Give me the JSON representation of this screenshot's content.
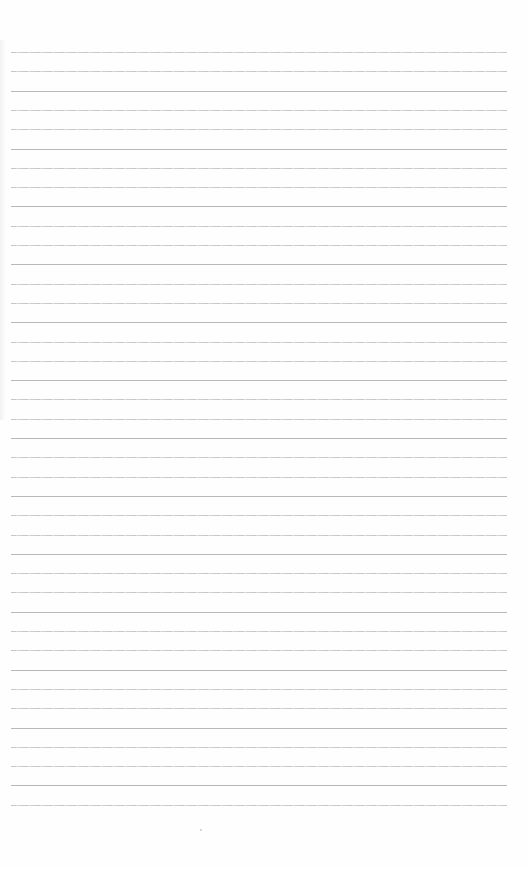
{
  "page": {
    "type": "blank ruled notebook paper",
    "background": "#fefefe",
    "rule_color": "#c4c4c4",
    "rule_count": 40,
    "rule_start_y": 52,
    "rule_spacing": 19.3,
    "rule_left": 11,
    "rule_right": 507,
    "text_content": ""
  }
}
